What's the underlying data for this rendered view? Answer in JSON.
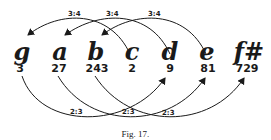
{
  "notes": [
    {
      "name": "g",
      "value": "3"
    },
    {
      "name": "a",
      "value": "27"
    },
    {
      "name": "b",
      "value": "243"
    },
    {
      "name": "c",
      "value": "2"
    },
    {
      "name": "d",
      "value": "9"
    },
    {
      "name": "e",
      "value": "81"
    },
    {
      "name": "f#",
      "value": "729"
    }
  ],
  "top_arcs": [
    {
      "from": "c",
      "to": "g",
      "label": "3:4"
    },
    {
      "from": "d",
      "to": "a",
      "label": "3:4"
    },
    {
      "from": "e",
      "to": "b",
      "label": "3:4"
    }
  ],
  "bottom_arcs": [
    {
      "from": "g",
      "to": "d",
      "label": "2:3"
    },
    {
      "from": "a",
      "to": "e",
      "label": "2:3"
    },
    {
      "from": "b",
      "to": "f#",
      "label": "2:3"
    }
  ],
  "caption": "Fig. 17."
}
